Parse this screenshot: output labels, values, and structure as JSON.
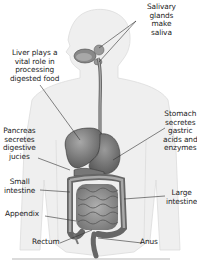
{
  "diagram": {
    "labels": {
      "salivary": [
        "Salivary",
        "glands",
        "make",
        "saliva"
      ],
      "liver": [
        "Liver plays a",
        "vital role in",
        "processing",
        "digested food"
      ],
      "stomach": [
        "Stomach",
        "secretes",
        "gastric",
        "acids and",
        "enzymes"
      ],
      "pancreas": [
        "Pancreas",
        "secretes",
        "digestive",
        "jucies"
      ],
      "small_intestine": [
        "Small",
        "intestine"
      ],
      "large_intestine": [
        "Large",
        "intestine"
      ],
      "appendix": [
        "Appendix"
      ],
      "rectum": [
        "Rectum"
      ],
      "anus": [
        "Anus"
      ]
    },
    "colors": {
      "body": "#eeeeee",
      "body_edge": "#d8d8d8",
      "organ_dark": "#5a5a5a",
      "organ_mid": "#8a8a8a",
      "organ_light": "#b5b5b5",
      "leader_line": "#333333",
      "text": "#222222"
    }
  }
}
